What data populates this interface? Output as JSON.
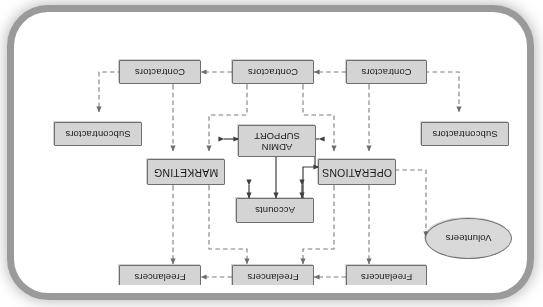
{
  "diagram": {
    "orientation": "rotated-180",
    "palette": {
      "node_fill": "#d4d4d4",
      "node_border": "#6e6e6e",
      "ellipse_fill": "#d9d9d9",
      "line_solid": "#4a4a4a",
      "line_dashed": "#8a8a8a",
      "page_background": "#ffffff",
      "frame_border": "#9a9a9a"
    },
    "nodes": [
      {
        "id": "freelancers-left",
        "label": "Freelancers",
        "shape": "rect",
        "row": "top"
      },
      {
        "id": "freelancers-center",
        "label": "Freelancers",
        "shape": "rect",
        "row": "top"
      },
      {
        "id": "freelancers-right",
        "label": "Freelancers",
        "shape": "rect",
        "row": "top"
      },
      {
        "id": "volunteers",
        "label": "Volunteers",
        "shape": "ellipse",
        "row": "upper-left"
      },
      {
        "id": "accounts",
        "label": "Accounts",
        "shape": "rect",
        "row": "core"
      },
      {
        "id": "operations",
        "label": "OPERATIONS",
        "shape": "rect",
        "row": "core"
      },
      {
        "id": "marketing",
        "label": "MARKETING",
        "shape": "rect",
        "row": "core"
      },
      {
        "id": "admin-support",
        "label": "ADMIN SUPPORT",
        "label_line1": "ADMIN",
        "label_line2": "SUPPORT",
        "shape": "rect",
        "row": "core"
      },
      {
        "id": "subcontractors-left",
        "label": "Subcontractors",
        "shape": "rect",
        "row": "mid-left"
      },
      {
        "id": "subcontractors-right",
        "label": "Subcontractors",
        "shape": "rect",
        "row": "mid-right"
      },
      {
        "id": "contractors-left",
        "label": "Contractors",
        "shape": "rect",
        "row": "bottom"
      },
      {
        "id": "contractors-center",
        "label": "Contractors",
        "shape": "rect",
        "row": "bottom"
      },
      {
        "id": "contractors-right",
        "label": "Contractors",
        "shape": "rect",
        "row": "bottom"
      }
    ],
    "edges": [
      {
        "from": "freelancers-center",
        "to": "freelancers-left",
        "style": "dashed",
        "arrows": "both"
      },
      {
        "from": "freelancers-right",
        "to": "freelancers-center",
        "style": "dashed",
        "arrows": "both"
      },
      {
        "from": "operations",
        "to": "freelancers-left",
        "style": "dashed",
        "arrows": "both"
      },
      {
        "from": "operations",
        "to": "freelancers-center",
        "style": "dashed",
        "arrows": "both"
      },
      {
        "from": "marketing",
        "to": "freelancers-center",
        "style": "dashed",
        "arrows": "both"
      },
      {
        "from": "marketing",
        "to": "freelancers-right",
        "style": "dashed",
        "arrows": "both"
      },
      {
        "from": "operations",
        "to": "volunteers",
        "style": "dashed",
        "arrows": "both"
      },
      {
        "from": "operations",
        "to": "accounts",
        "style": "solid",
        "arrows": "both"
      },
      {
        "from": "admin-support",
        "to": "accounts",
        "style": "solid",
        "arrows": "both"
      },
      {
        "from": "marketing",
        "to": "accounts",
        "style": "solid",
        "arrows": "both"
      },
      {
        "from": "operations",
        "to": "admin-support",
        "style": "solid",
        "arrows": "both"
      },
      {
        "from": "marketing",
        "to": "admin-support",
        "style": "solid",
        "arrows": "both"
      },
      {
        "from": "contractors-left",
        "to": "operations",
        "style": "dashed",
        "arrows": "both"
      },
      {
        "from": "contractors-center",
        "to": "operations",
        "style": "dashed",
        "arrows": "both"
      },
      {
        "from": "contractors-center",
        "to": "marketing",
        "style": "dashed",
        "arrows": "both"
      },
      {
        "from": "contractors-right",
        "to": "marketing",
        "style": "dashed",
        "arrows": "both"
      },
      {
        "from": "contractors-center",
        "to": "contractors-left",
        "style": "dashed",
        "arrows": "both"
      },
      {
        "from": "contractors-right",
        "to": "contractors-center",
        "style": "dashed",
        "arrows": "both"
      },
      {
        "from": "contractors-left",
        "to": "subcontractors-left",
        "style": "dashed",
        "arrows": "both"
      },
      {
        "from": "contractors-right",
        "to": "subcontractors-right",
        "style": "dashed",
        "arrows": "both"
      }
    ]
  }
}
